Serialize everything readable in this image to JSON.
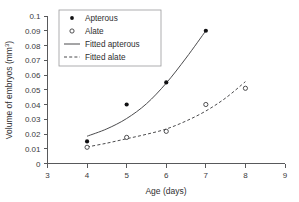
{
  "chart_data": {
    "type": "scatter",
    "title": "",
    "xlabel": "Age (days)",
    "ylabel": "Volume of embryos (mm³)",
    "ylabel_base": "Volume of embryos (mm",
    "ylabel_sup": "3",
    "ylabel_tail": ")",
    "xlim": [
      3,
      9
    ],
    "ylim": [
      0,
      0.1
    ],
    "grid": false,
    "legend_position": "top-left-inside",
    "xticks": [
      3,
      4,
      5,
      6,
      7,
      8,
      9
    ],
    "xtick_labels": [
      "3",
      "4",
      "5",
      "6",
      "7",
      "8",
      "9"
    ],
    "yticks": [
      0,
      0.01,
      0.02,
      0.03,
      0.04,
      0.05,
      0.06,
      0.07,
      0.08,
      0.09,
      0.1
    ],
    "ytick_labels": [
      "0",
      "0.01",
      "0.02",
      "0.03",
      "0.04",
      "0.05",
      "0.06",
      "0.07",
      "0.08",
      "0.09",
      "0.1"
    ],
    "series": [
      {
        "name": "Apterous",
        "marker": "filled-circle",
        "x": [
          4,
          5,
          6,
          7
        ],
        "values": [
          0.015,
          0.04,
          0.055,
          0.09
        ]
      },
      {
        "name": "Alate",
        "marker": "open-circle",
        "x": [
          4,
          5,
          6,
          7,
          8
        ],
        "values": [
          0.011,
          0.0177,
          0.0218,
          0.04,
          0.051
        ]
      },
      {
        "name": "Fitted apterous",
        "marker": "solid-line",
        "x": [
          4,
          4.5,
          5,
          5.5,
          6,
          6.5,
          7
        ],
        "values": [
          0.0185,
          0.0235,
          0.0305,
          0.0405,
          0.0545,
          0.0715,
          0.09
        ]
      },
      {
        "name": "Fitted alate",
        "marker": "dashed-line",
        "x": [
          4,
          4.5,
          5,
          5.5,
          6,
          6.5,
          7,
          7.5,
          8
        ],
        "values": [
          0.0112,
          0.0138,
          0.0168,
          0.0198,
          0.0234,
          0.0288,
          0.0356,
          0.0444,
          0.0555
        ]
      }
    ],
    "legend": [
      {
        "label": "Apterous",
        "marker": "filled-circle"
      },
      {
        "label": "Alate",
        "marker": "open-circle"
      },
      {
        "label": "Fitted apterous",
        "marker": "solid-line"
      },
      {
        "label": "Fitted alate",
        "marker": "dashed-line"
      }
    ]
  }
}
